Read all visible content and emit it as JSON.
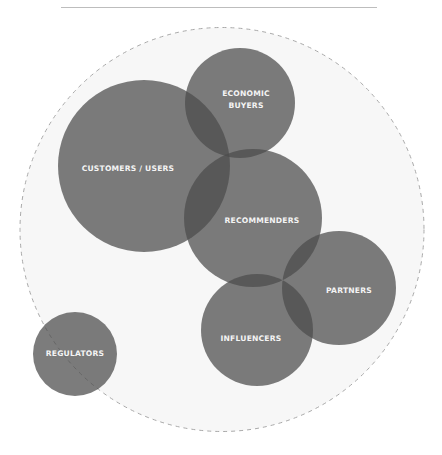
{
  "diagram": {
    "type": "overlapping-circles (venn-style stakeholder map)",
    "boundary": {
      "style": "dashed",
      "center": [
        222,
        229
      ],
      "radius": 202,
      "fill": "#f7f7f7",
      "stroke": "#a8a8a8"
    },
    "circle_fill": "rgba(75,75,75,0.73)",
    "nodes": [
      {
        "id": "customers",
        "label_lines": [
          "CUSTOMERS / USERS"
        ],
        "center": [
          144,
          166
        ],
        "radius": 86,
        "label_pos": [
          128,
          169
        ]
      },
      {
        "id": "economic-buyers",
        "label_lines": [
          "ECONOMIC",
          "BUYERS"
        ],
        "center": [
          240,
          103
        ],
        "radius": 55,
        "label_pos": [
          246,
          93
        ]
      },
      {
        "id": "recommenders",
        "label_lines": [
          "RECOMMENDERS"
        ],
        "center": [
          253,
          218
        ],
        "radius": 69,
        "label_pos": [
          262,
          221
        ]
      },
      {
        "id": "partners",
        "label_lines": [
          "PARTNERS"
        ],
        "center": [
          339,
          288
        ],
        "radius": 57,
        "label_pos": [
          349,
          291
        ]
      },
      {
        "id": "influencers",
        "label_lines": [
          "INFLUENCERS"
        ],
        "center": [
          257,
          330
        ],
        "radius": 56,
        "label_pos": [
          251,
          339
        ]
      },
      {
        "id": "regulators",
        "label_lines": [
          "REGULATORS"
        ],
        "center": [
          75,
          354
        ],
        "radius": 42,
        "label_pos": [
          75,
          353
        ]
      }
    ]
  },
  "labels": {
    "customers": "CUSTOMERS / USERS",
    "economic_1": "ECONOMIC",
    "economic_2": "BUYERS",
    "recommenders": "RECOMMENDERS",
    "partners": "PARTNERS",
    "influencers": "INFLUENCERS",
    "regulators": "REGULATORS"
  }
}
